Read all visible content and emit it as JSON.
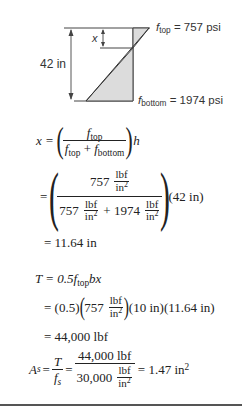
{
  "diagram": {
    "height_label": "42 in",
    "x_label": "x",
    "f_top_label": {
      "sym": "f",
      "sub": "top",
      "rest": " = 757 psi"
    },
    "f_bottom_label": {
      "sym": "f",
      "sub": "bottom",
      "rest": " = 1974 psi"
    },
    "fill_color": "#dcdcdc",
    "line_color": "#444444"
  },
  "equations": {
    "x_def": {
      "lhs": "x =",
      "num_f": "f",
      "num_sub": "top",
      "den_f1": "f",
      "den_sub1": "top",
      "den_plus": " + ",
      "den_f2": "f",
      "den_sub2": "bottom",
      "tail": "h"
    },
    "x_subst": {
      "eq": "=",
      "num_val": "757",
      "unit_num": "lbf",
      "unit_den": "in",
      "unit_exp": "2",
      "den_val1": "757",
      "den_plus": "+ 1974",
      "tail": "(42 in)"
    },
    "x_result": "= 11.64 in",
    "t_def": {
      "lhs": "T = 0.5",
      "f": "f",
      "sub": "top",
      "rest": "bx"
    },
    "t_subst": {
      "part1": "= (0.5)",
      "val": "757",
      "unit_num": "lbf",
      "unit_den": "in",
      "unit_exp": "2",
      "part2": "(10 in)(11.64 in)"
    },
    "t_result": "= 44,000 lbf",
    "as_def": {
      "lhs_sym": "A",
      "lhs_sub": "s",
      "eq1": "=",
      "t_num": "T",
      "t_den": "f",
      "t_den_sub": "s",
      "eq2": "=",
      "num": "44,000 lbf",
      "den_val": "30,000",
      "unit_num": "lbf",
      "unit_den": "in",
      "unit_exp": "2",
      "result": "= 1.47 in",
      "result_exp": "2"
    }
  }
}
